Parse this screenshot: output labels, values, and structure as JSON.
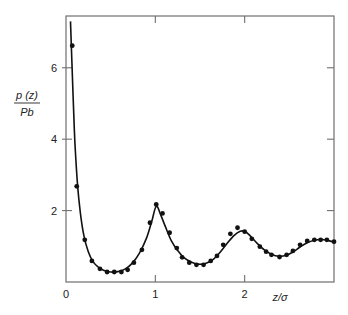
{
  "chart_data": {
    "type": "line",
    "title": "",
    "xlabel": "z/σ",
    "ylabel_numerator": "p (z)",
    "ylabel_denominator": "Pb",
    "xlim": [
      0,
      3.0
    ],
    "ylim": [
      0,
      7.45
    ],
    "grid": false,
    "legend": null,
    "x_ticks": [
      0,
      1,
      2
    ],
    "x_tick_labels": [
      "0",
      "1",
      "2"
    ],
    "y_ticks": [
      2,
      4,
      6
    ],
    "y_tick_labels": [
      "2",
      "4",
      "6"
    ],
    "series": [
      {
        "name": "theory",
        "style": "solid-line",
        "color": "#111111",
        "points": [
          [
            0.05,
            7.3
          ],
          [
            0.08,
            5.2
          ],
          [
            0.1,
            3.9
          ],
          [
            0.13,
            2.7
          ],
          [
            0.16,
            1.95
          ],
          [
            0.2,
            1.3
          ],
          [
            0.25,
            0.85
          ],
          [
            0.3,
            0.58
          ],
          [
            0.36,
            0.42
          ],
          [
            0.42,
            0.33
          ],
          [
            0.5,
            0.28
          ],
          [
            0.58,
            0.29
          ],
          [
            0.66,
            0.36
          ],
          [
            0.74,
            0.52
          ],
          [
            0.82,
            0.8
          ],
          [
            0.9,
            1.22
          ],
          [
            0.96,
            1.7
          ],
          [
            1.01,
            2.12
          ],
          [
            1.06,
            1.88
          ],
          [
            1.12,
            1.5
          ],
          [
            1.18,
            1.15
          ],
          [
            1.25,
            0.88
          ],
          [
            1.32,
            0.68
          ],
          [
            1.4,
            0.56
          ],
          [
            1.48,
            0.5
          ],
          [
            1.56,
            0.52
          ],
          [
            1.64,
            0.62
          ],
          [
            1.72,
            0.82
          ],
          [
            1.8,
            1.07
          ],
          [
            1.88,
            1.3
          ],
          [
            1.95,
            1.42
          ],
          [
            2.0,
            1.42
          ],
          [
            2.06,
            1.3
          ],
          [
            2.14,
            1.08
          ],
          [
            2.22,
            0.9
          ],
          [
            2.3,
            0.78
          ],
          [
            2.38,
            0.72
          ],
          [
            2.46,
            0.74
          ],
          [
            2.54,
            0.84
          ],
          [
            2.62,
            0.98
          ],
          [
            2.7,
            1.1
          ],
          [
            2.78,
            1.17
          ],
          [
            2.86,
            1.19
          ],
          [
            2.94,
            1.16
          ],
          [
            3.0,
            1.12
          ]
        ]
      },
      {
        "name": "simulation",
        "style": "dots",
        "color": "#111111",
        "points": [
          [
            0.07,
            6.62
          ],
          [
            0.12,
            2.68
          ],
          [
            0.21,
            1.18
          ],
          [
            0.29,
            0.59
          ],
          [
            0.38,
            0.37
          ],
          [
            0.46,
            0.28
          ],
          [
            0.54,
            0.28
          ],
          [
            0.62,
            0.28
          ],
          [
            0.69,
            0.34
          ],
          [
            0.76,
            0.54
          ],
          [
            0.85,
            0.9
          ],
          [
            0.94,
            1.66
          ],
          [
            1.01,
            2.17
          ],
          [
            1.08,
            1.92
          ],
          [
            1.16,
            1.38
          ],
          [
            1.24,
            0.95
          ],
          [
            1.3,
            0.69
          ],
          [
            1.38,
            0.54
          ],
          [
            1.46,
            0.48
          ],
          [
            1.54,
            0.48
          ],
          [
            1.62,
            0.59
          ],
          [
            1.69,
            0.73
          ],
          [
            1.76,
            1.04
          ],
          [
            1.84,
            1.35
          ],
          [
            1.92,
            1.52
          ],
          [
            2.0,
            1.41
          ],
          [
            2.08,
            1.21
          ],
          [
            2.17,
            0.99
          ],
          [
            2.24,
            0.85
          ],
          [
            2.3,
            0.76
          ],
          [
            2.39,
            0.7
          ],
          [
            2.47,
            0.76
          ],
          [
            2.54,
            0.87
          ],
          [
            2.62,
            1.04
          ],
          [
            2.7,
            1.15
          ],
          [
            2.78,
            1.18
          ],
          [
            2.85,
            1.18
          ],
          [
            2.92,
            1.18
          ],
          [
            3.0,
            1.13
          ]
        ]
      }
    ]
  },
  "layout": {
    "plot_left": 66,
    "plot_right": 334,
    "plot_top": 16,
    "plot_bottom": 282,
    "frame_color": "#6f6f6f"
  }
}
